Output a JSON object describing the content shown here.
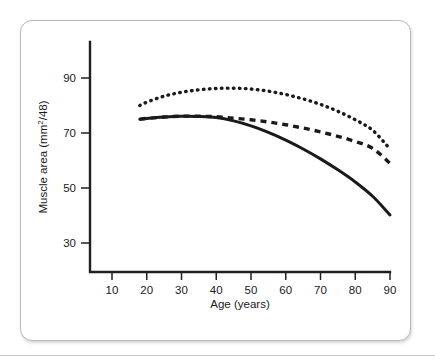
{
  "chart_data": {
    "type": "line",
    "title": "",
    "xlabel": "Age (years)",
    "ylabel": "Muscle area (mm2/48)",
    "ylabel_base": "Muscle area (mm",
    "ylabel_sup": "2",
    "ylabel_tail": "/48)",
    "xlim": [
      5,
      93
    ],
    "ylim": [
      22,
      100
    ],
    "grid": false,
    "legend": "none",
    "xticks": [
      10,
      20,
      30,
      40,
      50,
      60,
      70,
      80,
      90
    ],
    "yticks": [
      30,
      50,
      70,
      90
    ],
    "x": [
      18,
      20,
      25,
      30,
      35,
      40,
      45,
      50,
      55,
      60,
      65,
      70,
      75,
      80,
      85,
      90
    ],
    "series": [
      {
        "name": "dotted-upper-curve",
        "style": "dotted",
        "color": "#1a1a1a",
        "values": [
          80.0,
          81.2,
          83.4,
          84.8,
          85.7,
          86.2,
          86.3,
          86.0,
          85.2,
          84.0,
          82.4,
          80.4,
          77.9,
          74.8,
          71.0,
          64.2
        ]
      },
      {
        "name": "dashed-middle-curve",
        "style": "dashed",
        "color": "#1a1a1a",
        "values": [
          75.0,
          75.3,
          75.8,
          76.1,
          76.1,
          75.9,
          75.4,
          74.8,
          74.0,
          73.0,
          71.8,
          70.4,
          68.8,
          66.9,
          64.4,
          59.0
        ]
      },
      {
        "name": "solid-lower-curve",
        "style": "solid",
        "color": "#1a1a1a",
        "values": [
          75.0,
          75.3,
          75.8,
          76.1,
          76.0,
          75.6,
          74.4,
          72.6,
          70.2,
          67.4,
          64.2,
          60.6,
          56.6,
          52.2,
          47.0,
          40.2
        ]
      }
    ]
  },
  "axis": {
    "x_tick_labels": [
      "10",
      "20",
      "30",
      "40",
      "50",
      "60",
      "70",
      "80",
      "90"
    ],
    "y_tick_labels": [
      "30",
      "50",
      "70",
      "90"
    ]
  }
}
